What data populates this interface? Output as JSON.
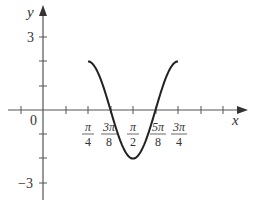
{
  "chart_data": {
    "type": "line",
    "title": "",
    "function": "y = -2cos(4x)",
    "xlabel": "x",
    "ylabel": "y",
    "domain": [
      "π/4",
      "3π/4"
    ],
    "xlim": [
      -0.39,
      1.57
    ],
    "ylim": [
      -3,
      3
    ],
    "grid": false,
    "x_tick_labels": [
      "π/4",
      "3π/8",
      "π/2",
      "5π/8",
      "3π/4"
    ],
    "y_tick_labels": [
      "3",
      "-3"
    ],
    "origin_label": "0",
    "series": [
      {
        "name": "y = -2cos(4x)",
        "x": [
          "π/4",
          "5π/16",
          "3π/8",
          "7π/16",
          "π/2",
          "9π/16",
          "5π/8",
          "11π/16",
          "3π/4"
        ],
        "values": [
          2,
          0,
          0,
          0,
          -2,
          0,
          0,
          0,
          2
        ],
        "key_points": [
          {
            "x": "π/4",
            "y": 2
          },
          {
            "x": "3π/8",
            "y": 0
          },
          {
            "x": "π/2",
            "y": -2
          },
          {
            "x": "5π/8",
            "y": 0
          },
          {
            "x": "3π/4",
            "y": 2
          }
        ]
      }
    ]
  },
  "axes": {
    "x_label": "x",
    "y_label": "y",
    "origin": "0",
    "y_top": "3",
    "y_bottom": "−3"
  },
  "ticks": {
    "pi4": {
      "num": "π",
      "den": "4"
    },
    "3pi8": {
      "num": "3π",
      "den": "8"
    },
    "pi2": {
      "num": "π",
      "den": "2"
    },
    "5pi8": {
      "num": "5π",
      "den": "8"
    },
    "3pi4": {
      "num": "3π",
      "den": "4"
    }
  },
  "colors": {
    "axis": "#444444",
    "curve": "#222222"
  }
}
